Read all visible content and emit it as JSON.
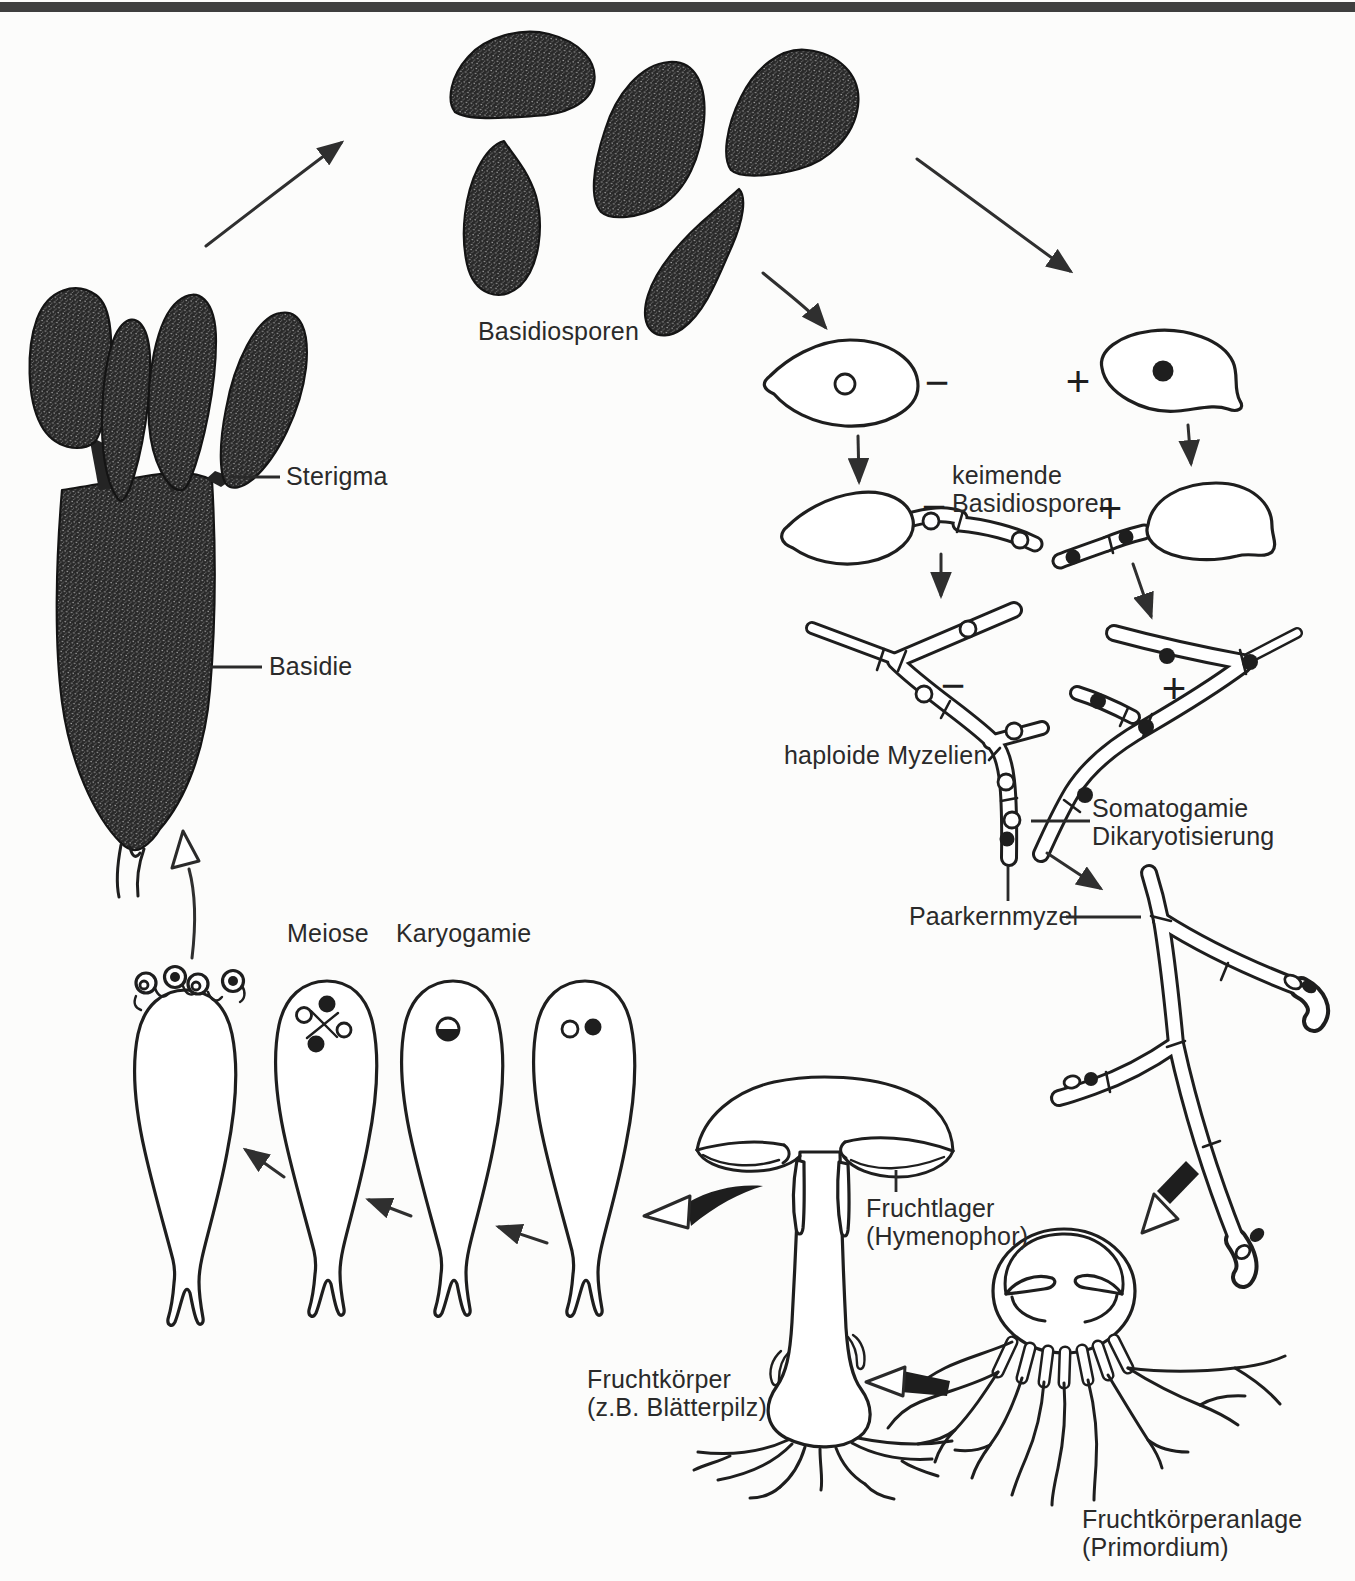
{
  "labels": {
    "basidiosporen": "Basidiosporen",
    "sterigma": "Sterigma",
    "basidie": "Basidie",
    "keimende_basidiosporen": "keimende\nBasidiosporen",
    "haploide_myzelien": "haploide Myzelien",
    "somatogamie": "Somatogamie\nDikaryotisierung",
    "paarkernmyzel": "Paarkernmyzel",
    "meiose": "Meiose",
    "karyogamie": "Karyogamie",
    "fruchtlager": "Fruchtlager\n(Hymenophor)",
    "fruchtkoerper": "Fruchtkörper\n(z.B. Blätterpilz)",
    "fruchtkoerperanlage": "Fruchtkörperanlage\n(Primordium)"
  },
  "signs": {
    "minus": "−",
    "plus": "+"
  },
  "colors": {
    "ink": "#1e1e1e",
    "label_text": "#2a2a2a",
    "background": "#fcfcfb",
    "top_bar": "#3f3f3f"
  }
}
